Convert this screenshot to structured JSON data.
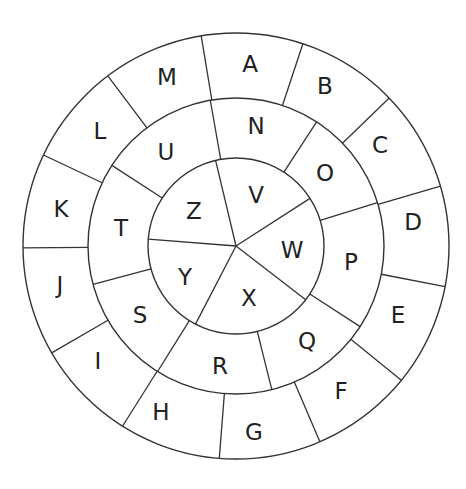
{
  "diagram": {
    "title": "",
    "center": [
      236,
      246
    ],
    "colors": {
      "stroke": "#333333",
      "text": "#222222",
      "background": "#ffffff"
    },
    "rings": {
      "outer": {
        "radius": 213,
        "inner_radius": 148,
        "spoke_angles": [
          -99.4,
          -71.7,
          -44.0,
          -16.3,
          11.0,
          39.1,
          66.8,
          94.5,
          122.2,
          149.9,
          179.5,
          205.3,
          233.0
        ],
        "letters": [
          {
            "label": "A",
            "x": 250,
            "y": 64
          },
          {
            "label": "B",
            "x": 325,
            "y": 86
          },
          {
            "label": "C",
            "x": 380,
            "y": 145
          },
          {
            "label": "D",
            "x": 413,
            "y": 222
          },
          {
            "label": "E",
            "x": 398,
            "y": 315
          },
          {
            "label": "F",
            "x": 341,
            "y": 391
          },
          {
            "label": "G",
            "x": 254,
            "y": 432
          },
          {
            "label": "H",
            "x": 161,
            "y": 412
          },
          {
            "label": "I",
            "x": 98,
            "y": 361
          },
          {
            "label": "J",
            "x": 60,
            "y": 285
          },
          {
            "label": "K",
            "x": 61,
            "y": 209
          },
          {
            "label": "L",
            "x": 100,
            "y": 131
          },
          {
            "label": "M",
            "x": 167,
            "y": 77
          }
        ]
      },
      "middle": {
        "radius": 148,
        "inner_radius": 88,
        "spoke_angles": [
          -100,
          -57,
          -17,
          33,
          76,
          122,
          165,
          -147
        ],
        "letters": [
          {
            "label": "N",
            "x": 256,
            "y": 126
          },
          {
            "label": "O",
            "x": 325,
            "y": 173
          },
          {
            "label": "P",
            "x": 351,
            "y": 262
          },
          {
            "label": "Q",
            "x": 307,
            "y": 341
          },
          {
            "label": "R",
            "x": 220,
            "y": 366
          },
          {
            "label": "S",
            "x": 140,
            "y": 315
          },
          {
            "label": "T",
            "x": 121,
            "y": 228
          },
          {
            "label": "U",
            "x": 166,
            "y": 152
          }
        ]
      },
      "inner": {
        "radius": 88,
        "spoke_angles": [
          -103.4,
          -32.8,
          37.6,
          117.4,
          184.5
        ],
        "letters": [
          {
            "label": "V",
            "x": 256,
            "y": 195
          },
          {
            "label": "W",
            "x": 292,
            "y": 250
          },
          {
            "label": "X",
            "x": 249,
            "y": 298
          },
          {
            "label": "Y",
            "x": 185,
            "y": 277
          },
          {
            "label": "Z",
            "x": 194,
            "y": 211
          }
        ]
      }
    }
  }
}
